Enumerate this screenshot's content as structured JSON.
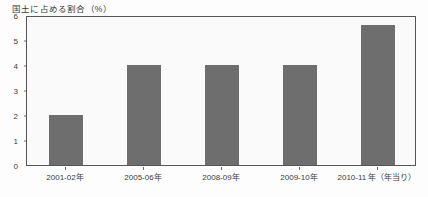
{
  "chart_data": {
    "type": "bar",
    "title": "国土に占める割合（%）",
    "xlabel": "",
    "ylabel": "",
    "categories": [
      "2001-02年",
      "2005-06年",
      "2008-09年",
      "2009-10年",
      "2010-11 年（年当り）"
    ],
    "values": [
      2.0,
      4.0,
      4.0,
      4.0,
      5.6
    ],
    "ylim": [
      0,
      6
    ],
    "yticks": [
      "0",
      "1",
      "2",
      "3",
      "4",
      "5",
      "6"
    ],
    "ytick_values": [
      0,
      1,
      2,
      3,
      4,
      5,
      6
    ],
    "grid": false,
    "legend": null,
    "bar_color": "#6e6e6e",
    "frame_color": "#555555",
    "plot_background": "#fafafa"
  }
}
